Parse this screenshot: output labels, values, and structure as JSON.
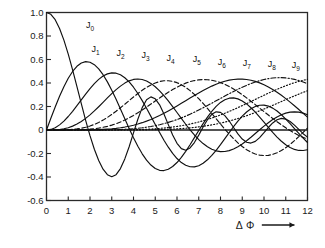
{
  "chart_data": {
    "type": "line",
    "title": "",
    "subtitle": "",
    "xlabel": "Δ Φ",
    "xlabel_arrow": "⟶",
    "ylabel": "",
    "xlim": [
      0,
      12
    ],
    "ylim": [
      -0.6,
      1.0
    ],
    "grid": false,
    "legend_position": "inline-curve-labels",
    "x_ticks": [
      "0",
      "1",
      "2",
      "3",
      "4",
      "5",
      "6",
      "7",
      "8",
      "9",
      "10",
      "11",
      "12"
    ],
    "x_tick_values": [
      0,
      1,
      2,
      3,
      4,
      5,
      6,
      7,
      8,
      9,
      10,
      11,
      12
    ],
    "y_ticks": [
      "1.0",
      "0.8",
      "0.6",
      "0.4",
      "0.2",
      "0",
      "-0.2",
      "-0.4",
      "-0.6"
    ],
    "y_tick_values": [
      1.0,
      0.8,
      0.6,
      0.4,
      0.2,
      0,
      -0.2,
      -0.4,
      -0.6
    ],
    "zero_line": 0,
    "line_color": "#101010",
    "axis_color": "#2a2a2a",
    "background": "#ffffff",
    "series": [
      {
        "name": "J0",
        "label": "J",
        "order": "0",
        "style": "solid",
        "label_x": 2.05,
        "label_y": 0.875,
        "values": [
          1.0,
          0.9844,
          0.9385,
          0.8642,
          0.7652,
          0.646,
          0.5118,
          0.369,
          0.2239,
          0.0827,
          -0.0484,
          -0.1641,
          -0.2601,
          -0.3332,
          -0.3801,
          -0.3971,
          -0.3801,
          -0.3282,
          -0.2459,
          -0.1422,
          -0.0245,
          0.0917,
          0.1906,
          0.2569,
          0.2818,
          0.2655,
          0.2139,
          0.1361,
          0.0457,
          -0.042,
          -0.113,
          -0.1585,
          -0.1719,
          -0.1528,
          -0.1067,
          -0.0435,
          0.0254,
          0.0879,
          0.1331,
          0.1546,
          0.1502,
          0.1222,
          0.0764,
          0.0213,
          -0.033,
          -0.0773,
          -0.1045,
          -0.1112,
          -0.0968,
          -0.0652,
          -0.0233,
          0.0211,
          0.0602,
          0.0874,
          0.0987,
          0.0931,
          0.0725,
          0.0413,
          0.0046,
          -0.0313,
          -0.0603
        ]
      },
      {
        "name": "J1",
        "label": "J",
        "order": "1",
        "style": "solid",
        "label_x": 2.3,
        "label_y": 0.675,
        "values": [
          0.0,
          0.0995,
          0.196,
          0.2867,
          0.3688,
          0.4401,
          0.4983,
          0.5419,
          0.5699,
          0.5815,
          0.5767,
          0.556,
          0.5202,
          0.4708,
          0.4097,
          0.3391,
          0.2613,
          0.1792,
          0.0955,
          0.0128,
          -0.066,
          -0.1386,
          -0.2028,
          -0.2566,
          -0.2985,
          -0.3276,
          -0.3432,
          -0.3453,
          -0.3343,
          -0.311,
          -0.2767,
          -0.2329,
          -0.1816,
          -0.125,
          -0.0652,
          -0.0047,
          0.0543,
          0.1096,
          0.1592,
          0.2014,
          0.2346,
          0.258,
          0.2708,
          0.2731,
          0.265,
          0.2476,
          0.2218,
          0.1892,
          0.1513,
          0.1098,
          0.0661,
          0.0223,
          -0.0202,
          -0.0599,
          -0.0955,
          -0.1255,
          -0.1491,
          -0.1654,
          -0.174,
          -0.1747,
          -0.1677
        ]
      },
      {
        "name": "J2",
        "label": "J",
        "order": "2",
        "style": "solid",
        "label_x": 3.45,
        "label_y": 0.635,
        "values": [
          0.0,
          0.005,
          0.0197,
          0.0437,
          0.0758,
          0.1149,
          0.1593,
          0.2074,
          0.257,
          0.3061,
          0.3528,
          0.3951,
          0.431,
          0.459,
          0.4777,
          0.4861,
          0.4835,
          0.4697,
          0.4448,
          0.4093,
          0.3641,
          0.3105,
          0.2501,
          0.1846,
          0.116,
          0.0466,
          -0.0217,
          -0.0867,
          -0.1464,
          -0.1989,
          -0.2429,
          -0.277,
          -0.3005,
          -0.3127,
          -0.3137,
          -0.3037,
          -0.2834,
          -0.2538,
          -0.2164,
          -0.1727,
          -0.1245,
          -0.0737,
          -0.0222,
          0.028,
          0.0752,
          0.1174,
          0.1532,
          0.1813,
          0.2008,
          0.2111,
          0.2119,
          0.2035,
          0.1863,
          0.1614,
          0.1299,
          0.0933,
          0.0534,
          0.0118,
          -0.0297,
          -0.0696,
          -0.1063
        ]
      },
      {
        "name": "J3",
        "label": "J",
        "order": "3",
        "style": "solid",
        "label_x": 4.6,
        "label_y": 0.62,
        "values": [
          0.0,
          0.0002,
          0.0013,
          0.0044,
          0.0102,
          0.0196,
          0.0329,
          0.0505,
          0.0725,
          0.0988,
          0.1289,
          0.1623,
          0.1981,
          0.2353,
          0.2727,
          0.3091,
          0.3432,
          0.3736,
          0.3991,
          0.4184,
          0.4303,
          0.4344,
          0.4301,
          0.4174,
          0.3967,
          0.3684,
          0.3334,
          0.2928,
          0.2476,
          0.1993,
          0.1491,
          0.0985,
          0.0489,
          0.0015,
          -0.0425,
          -0.0818,
          -0.1156,
          -0.1432,
          -0.1638,
          -0.1773,
          -0.1836,
          -0.1828,
          -0.1753,
          -0.1617,
          -0.1425,
          -0.1188,
          -0.0914,
          -0.0615,
          -0.0301,
          0.0016,
          0.0327,
          0.062,
          0.0886,
          0.1116,
          0.1301,
          0.1437,
          0.1519,
          0.1546,
          0.1518,
          0.1436,
          0.1304
        ]
      },
      {
        "name": "J4",
        "label": "J",
        "order": "4",
        "style": "dashed",
        "label_x": 5.75,
        "label_y": 0.6,
        "values": [
          0.0,
          0.0,
          0.0001,
          0.0003,
          0.001,
          0.0025,
          0.005,
          0.0091,
          0.015,
          0.0232,
          0.034,
          0.0476,
          0.0643,
          0.084,
          0.1067,
          0.132,
          0.1597,
          0.1891,
          0.2196,
          0.2505,
          0.2811,
          0.3105,
          0.3379,
          0.3626,
          0.3837,
          0.4004,
          0.4123,
          0.4187,
          0.4194,
          0.4142,
          0.4029,
          0.3859,
          0.3632,
          0.3354,
          0.3029,
          0.2663,
          0.2264,
          0.184,
          0.1399,
          0.095,
          0.0504,
          0.0068,
          -0.0349,
          -0.0739,
          -0.1094,
          -0.1406,
          -0.1672,
          -0.1885,
          -0.2042,
          -0.2141,
          -0.2179,
          -0.2157,
          -0.2076,
          -0.1938,
          -0.1747,
          -0.1507,
          -0.1225,
          -0.0908,
          -0.0565,
          -0.0204,
          0.0166
        ]
      },
      {
        "name": "J5",
        "label": "J",
        "order": "5",
        "style": "dashed",
        "label_x": 6.95,
        "label_y": 0.585,
        "values": [
          0.0,
          0.0,
          0.0,
          0.0,
          0.0001,
          0.0002,
          0.0006,
          0.0013,
          0.0025,
          0.0043,
          0.007,
          0.0108,
          0.016,
          0.0227,
          0.0311,
          0.0415,
          0.0538,
          0.0683,
          0.0849,
          0.1035,
          0.1241,
          0.1464,
          0.1702,
          0.195,
          0.2207,
          0.2466,
          0.2724,
          0.2976,
          0.3216,
          0.3441,
          0.3648,
          0.3831,
          0.3987,
          0.4114,
          0.4208,
          0.4268,
          0.4293,
          0.4281,
          0.4233,
          0.4149,
          0.403,
          0.3878,
          0.3697,
          0.3488,
          0.3255,
          0.3001,
          0.2732,
          0.2449,
          0.2158,
          0.1862,
          0.1565,
          0.1271,
          0.0982,
          0.0703,
          0.0436,
          0.0184,
          -0.005,
          -0.0265,
          -0.0459,
          -0.0629,
          -0.0776
        ]
      },
      {
        "name": "J6",
        "label": "J",
        "order": "6",
        "style": "solid",
        "label_x": 8.1,
        "label_y": 0.565,
        "values": [
          0.0,
          0.0,
          0.0,
          0.0,
          0.0,
          0.0,
          0.0001,
          0.0002,
          0.0004,
          0.0007,
          0.0012,
          0.002,
          0.0032,
          0.0049,
          0.0072,
          0.0102,
          0.0141,
          0.019,
          0.025,
          0.0323,
          0.0409,
          0.0509,
          0.0624,
          0.0755,
          0.09,
          0.1061,
          0.1235,
          0.1422,
          0.1621,
          0.183,
          0.2046,
          0.2268,
          0.2493,
          0.2717,
          0.2939,
          0.3155,
          0.3362,
          0.3557,
          0.3736,
          0.3897,
          0.4036,
          0.4152,
          0.4241,
          0.4302,
          0.4333,
          0.4333,
          0.4301,
          0.4237,
          0.4141,
          0.4013,
          0.3855,
          0.3668,
          0.3453,
          0.3213,
          0.2951,
          0.267,
          0.2373,
          0.2063,
          0.1744,
          0.142,
          0.1096
        ]
      },
      {
        "name": "J7",
        "label": "J",
        "order": "7",
        "style": "dashdot",
        "label_x": 9.25,
        "label_y": 0.555,
        "values": [
          0.0,
          0.0,
          0.0,
          0.0,
          0.0,
          0.0,
          0.0,
          0.0,
          0.0001,
          0.0001,
          0.0002,
          0.0003,
          0.0005,
          0.0009,
          0.0014,
          0.0021,
          0.0031,
          0.0044,
          0.0062,
          0.0084,
          0.0112,
          0.0147,
          0.0189,
          0.024,
          0.03,
          0.037,
          0.0451,
          0.0543,
          0.0647,
          0.0763,
          0.0891,
          0.1031,
          0.1182,
          0.1345,
          0.1517,
          0.1698,
          0.1887,
          0.2082,
          0.2282,
          0.2484,
          0.2687,
          0.2889,
          0.3087,
          0.328,
          0.3465,
          0.364,
          0.3803,
          0.3952,
          0.4085,
          0.42,
          0.4295,
          0.437,
          0.4422,
          0.445,
          0.4453,
          0.4431,
          0.4382,
          0.4308,
          0.4208,
          0.4082,
          0.3931
        ]
      },
      {
        "name": "J8",
        "label": "J",
        "order": "8",
        "style": "dotted",
        "label_x": 10.4,
        "label_y": 0.545,
        "values": [
          0.0,
          0.0,
          0.0,
          0.0,
          0.0,
          0.0,
          0.0,
          0.0,
          0.0,
          0.0,
          0.0,
          0.0,
          0.0001,
          0.0001,
          0.0002,
          0.0004,
          0.0006,
          0.0009,
          0.0013,
          0.0019,
          0.0026,
          0.0036,
          0.0048,
          0.0064,
          0.0083,
          0.0106,
          0.0134,
          0.0167,
          0.0206,
          0.0251,
          0.0303,
          0.0363,
          0.043,
          0.0506,
          0.059,
          0.0683,
          0.0785,
          0.0896,
          0.1016,
          0.1145,
          0.1282,
          0.1427,
          0.158,
          0.1739,
          0.1905,
          0.2075,
          0.2249,
          0.2426,
          0.2604,
          0.2782,
          0.2958,
          0.3132,
          0.3301,
          0.3464,
          0.362,
          0.3766,
          0.3902,
          0.4026,
          0.4136,
          0.4232,
          0.4311
        ]
      },
      {
        "name": "J9",
        "label": "J",
        "order": "9",
        "style": "dotted",
        "label_x": 11.5,
        "label_y": 0.535,
        "values": [
          0.0,
          0.0,
          0.0,
          0.0,
          0.0,
          0.0,
          0.0,
          0.0,
          0.0,
          0.0,
          0.0,
          0.0,
          0.0,
          0.0,
          0.0,
          0.0001,
          0.0001,
          0.0002,
          0.0002,
          0.0004,
          0.0005,
          0.0008,
          0.0011,
          0.0015,
          0.0021,
          0.0028,
          0.0037,
          0.0048,
          0.0061,
          0.0078,
          0.0098,
          0.0122,
          0.015,
          0.0183,
          0.0221,
          0.0265,
          0.0315,
          0.0372,
          0.0435,
          0.0506,
          0.0584,
          0.067,
          0.0764,
          0.0866,
          0.0976,
          0.1093,
          0.1218,
          0.135,
          0.1489,
          0.1634,
          0.1784,
          0.1939,
          0.2097,
          0.2258,
          0.242,
          0.2582,
          0.2743,
          0.2901,
          0.3055,
          0.3203,
          0.3343
        ]
      }
    ]
  }
}
